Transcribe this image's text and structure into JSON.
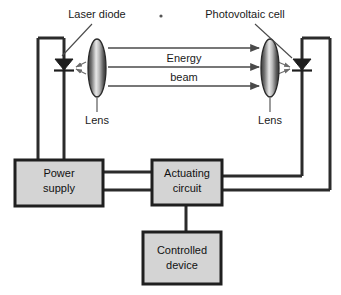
{
  "diagram": {
    "background_color": "#ffffff",
    "labels": {
      "laser_diode": "Laser diode",
      "photovoltaic_cell": "Photovoltaic cell",
      "energy": "Energy",
      "beam": "beam",
      "lens_left": "Lens",
      "lens_right": "Lens"
    },
    "boxes": [
      {
        "id": "power-supply",
        "line1": "Power",
        "line2": "supply",
        "fill": "#d4d4d4",
        "stroke": "#1f1f1f"
      },
      {
        "id": "actuating-circuit",
        "line1": "Actuating",
        "line2": "circuit",
        "fill": "#d4d4d4",
        "stroke": "#1f1f1f"
      },
      {
        "id": "controlled-device",
        "line1": "Controlled",
        "line2": "device",
        "fill": "#d4d4d4",
        "stroke": "#1f1f1f"
      }
    ],
    "components": {
      "laser_diode_icon": "laser-diode-symbol",
      "photovoltaic_cell_icon": "photodiode-symbol",
      "lens_icon": "convex-lens-ellipse"
    },
    "beam_arrows": {
      "count": 3,
      "direction": "left-to-right",
      "color": "#4a4a4a"
    },
    "colors": {
      "wire": "#2b2b2b",
      "box_fill": "#d4d4d4",
      "box_border": "#1f1f1f",
      "text": "#1a1a1a",
      "beam": "#4a4a4a",
      "lens_edge": "#3a3a3a",
      "lens_center": "#e8e8e8"
    }
  }
}
